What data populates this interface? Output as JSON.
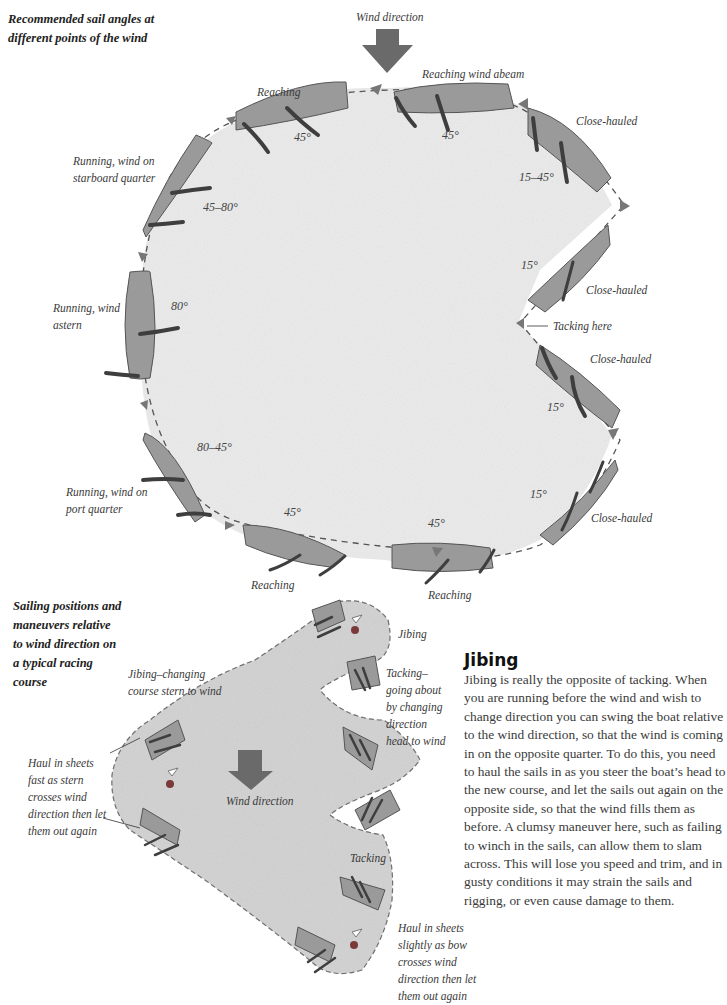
{
  "top_diagram": {
    "caption": "Recommended sail angles at different points of the wind",
    "wind_direction_label": "Wind direction",
    "positions": [
      {
        "label": "Reaching",
        "angle": "45°"
      },
      {
        "label": "Reaching wind abeam",
        "angle": "45°"
      },
      {
        "label": "Close-hauled",
        "angle": "15–45°"
      },
      {
        "label": "Close-hauled",
        "angle": "15°"
      },
      {
        "label": "Tacking here",
        "angle": ""
      },
      {
        "label": "Close-hauled",
        "angle": "15°"
      },
      {
        "label": "Close-hauled",
        "angle": "15°"
      },
      {
        "label": "Reaching",
        "angle": "45°"
      },
      {
        "label": "Reaching",
        "angle": "45°"
      },
      {
        "label": "Running, wind on port quarter",
        "angle": "80–45°"
      },
      {
        "label": "Running, wind astern",
        "angle": "80°"
      },
      {
        "label": "Running, wind on starboard quarter",
        "angle": "45–80°"
      }
    ]
  },
  "bottom_diagram": {
    "caption": "Sailing positions and maneuvers relative to wind direction on a typical racing course",
    "wind_direction_label": "Wind direction",
    "labels": {
      "jibing_changing": "Jibing–changing course stern to wind",
      "haul_fast": "Haul in sheets fast as stern crosses wind direction then let them out again",
      "jibing": "Jibing",
      "tacking_going_about": "Tacking–going about by changing direction head to wind",
      "tacking": "Tacking",
      "haul_slightly": "Haul in sheets slightly as bow crosses wind direction then let them out again"
    }
  },
  "article": {
    "heading": "Jibing",
    "body": "Jibing is really the opposite of tacking. When you are running before the wind and wish to change direction you can swing the boat relative to the wind direction, so that the wind is coming in on the opposite quarter. To do this, you need to haul the sails in as you steer the boat’s head to the new course, and let the sails out again on the opposite side, so that the wind fills them as before. A clumsy maneuver here, such as failing to winch in the sails, can allow them to slam across. This will lose you speed and trim, and in gusty conditions it may strain the sails and rigging, or even cause damage to them."
  },
  "colors": {
    "water": "#e9e9e9",
    "water_bottom": "#d6d6d6",
    "hull": "#9a9a9a",
    "hull_stroke": "#555555",
    "sail": "#3e3e3e",
    "arrow": "#6a6a6a"
  }
}
